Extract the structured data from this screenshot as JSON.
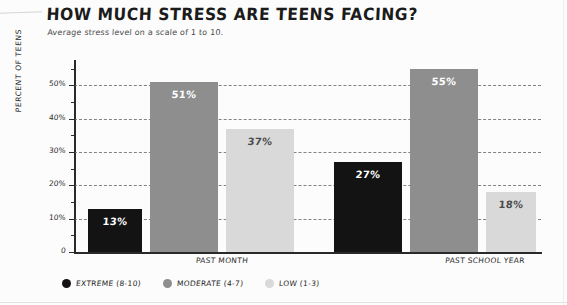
{
  "header": {
    "title": "HOW MUCH STRESS ARE TEENS FACING?",
    "subtitle": "Average stress level on a scale of 1 to 10."
  },
  "axis": {
    "y_title": "PERCENT OF TEENS",
    "ticks": [
      "50%",
      "40%",
      "30%",
      "20%",
      "10%",
      "0"
    ]
  },
  "groups": [
    {
      "label": "PAST MONTH"
    },
    {
      "label": "PAST SCHOOL YEAR"
    }
  ],
  "bars": [
    {
      "series": "extreme",
      "group": "PAST MONTH",
      "label": "13%",
      "value": 13
    },
    {
      "series": "moderate",
      "group": "PAST MONTH",
      "label": "51%",
      "value": 51
    },
    {
      "series": "low",
      "group": "PAST MONTH",
      "label": "37%",
      "value": 37
    },
    {
      "series": "extreme",
      "group": "PAST SCHOOL YEAR",
      "label": "27%",
      "value": 27
    },
    {
      "series": "moderate",
      "group": "PAST SCHOOL YEAR",
      "label": "55%",
      "value": 55
    },
    {
      "series": "low",
      "group": "PAST SCHOOL YEAR",
      "label": "18%",
      "value": 18
    }
  ],
  "legend": [
    {
      "label": "EXTREME (8-10)",
      "color": "#131313"
    },
    {
      "label": "MODERATE (4-7)",
      "color": "#8e8e8e"
    },
    {
      "label": "LOW (1-3)",
      "color": "#d9d9d9"
    }
  ],
  "colors": {
    "extreme": "#131313",
    "moderate": "#8e8e8e",
    "low": "#d9d9d9",
    "axis": "#2a2a2a",
    "grid": "#6f6f6f",
    "background": "#fcfcfc"
  },
  "chart_data": {
    "type": "bar",
    "title": "HOW MUCH STRESS ARE TEENS FACING?",
    "subtitle": "Average stress level on a scale of 1 to 10.",
    "xlabel": "",
    "ylabel": "PERCENT OF TEENS",
    "categories": [
      "PAST MONTH",
      "PAST SCHOOL YEAR"
    ],
    "series": [
      {
        "name": "EXTREME (8-10)",
        "values": [
          13,
          51
        ],
        "color": "#131313"
      },
      {
        "name": "MODERATE (4-7)",
        "values": [
          51,
          55
        ],
        "color": "#8e8e8e"
      },
      {
        "name": "LOW (1-3)",
        "values": [
          37,
          18
        ],
        "color": "#d9d9d9"
      }
    ],
    "series_corrected": [
      {
        "name": "EXTREME (8-10)",
        "values": [
          13,
          27
        ],
        "color": "#131313"
      },
      {
        "name": "MODERATE (4-7)",
        "values": [
          51,
          55
        ],
        "color": "#8e8e8e"
      },
      {
        "name": "LOW (1-3)",
        "values": [
          37,
          18
        ],
        "color": "#d9d9d9"
      }
    ],
    "ylim": [
      0,
      57
    ],
    "yticks": [
      0,
      10,
      20,
      30,
      40,
      50
    ],
    "ytick_labels": [
      "0",
      "10%",
      "20%",
      "30%",
      "40%",
      "50%"
    ],
    "grid": true,
    "grid_style": "dashed-horizontal",
    "legend_position": "bottom-left",
    "data_labels": true,
    "style": "hand-drawn"
  }
}
